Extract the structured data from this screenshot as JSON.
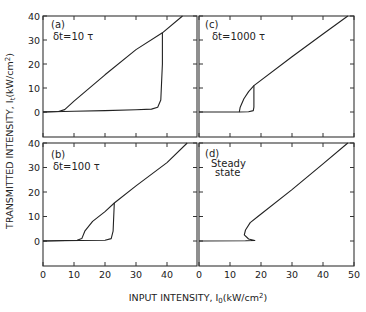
{
  "chart_data": {
    "type": "line",
    "title": "",
    "xlabel": "INPUT INTENSITY, I0(kW/cm2)",
    "ylabel": "TRANSMITTED INTENSITY, It(kW/cm2)",
    "layout": "2x2 grid of panels sharing axes",
    "grid": false,
    "xlim": [
      0,
      50
    ],
    "ylim": [
      -10,
      40
    ],
    "x_ticks_left": [
      0,
      10,
      20,
      30,
      40
    ],
    "x_ticks_right": [
      0,
      10,
      20,
      30,
      40,
      50
    ],
    "y_ticks": [
      0,
      10,
      20,
      30,
      40
    ],
    "panels": [
      {
        "id": "a",
        "label": "(a)",
        "annotation": "δt=10 τ",
        "position": "top-left",
        "series": [
          {
            "name": "upper branch",
            "points": [
              [
                0,
                0
              ],
              [
                5,
                0.2
              ],
              [
                7,
                1
              ],
              [
                10,
                4.5
              ],
              [
                20,
                15.5
              ],
              [
                30,
                26
              ],
              [
                38.5,
                33
              ],
              [
                45,
                40
              ]
            ]
          },
          {
            "name": "lower branch",
            "points": [
              [
                0,
                0
              ],
              [
                10,
                0.3
              ],
              [
                20,
                0.6
              ],
              [
                30,
                0.9
              ],
              [
                35,
                1.2
              ],
              [
                37,
                2
              ],
              [
                38,
                5
              ],
              [
                38.5,
                20
              ],
              [
                38.5,
                33
              ]
            ]
          }
        ]
      },
      {
        "id": "b",
        "label": "(b)",
        "annotation": "δt=100 τ",
        "position": "bottom-left",
        "series": [
          {
            "name": "upper branch",
            "points": [
              [
                0,
                0
              ],
              [
                11,
                0.3
              ],
              [
                12.5,
                1
              ],
              [
                13.5,
                4
              ],
              [
                16,
                8
              ],
              [
                20,
                12
              ],
              [
                23,
                15.5
              ],
              [
                30,
                22.5
              ],
              [
                40,
                32
              ],
              [
                46.5,
                40
              ]
            ]
          },
          {
            "name": "lower branch",
            "points": [
              [
                0,
                0
              ],
              [
                12,
                0.2
              ],
              [
                20,
                0.3
              ],
              [
                22,
                1
              ],
              [
                22.6,
                4
              ],
              [
                23,
                15.5
              ]
            ]
          }
        ]
      },
      {
        "id": "c",
        "label": "(c)",
        "annotation": "δt=1000 τ",
        "position": "top-right",
        "series": [
          {
            "name": "upper branch",
            "points": [
              [
                0,
                0
              ],
              [
                13,
                0
              ],
              [
                13.3,
                2
              ],
              [
                14.5,
                5.5
              ],
              [
                16,
                8.5
              ],
              [
                17.7,
                11
              ],
              [
                30,
                23
              ],
              [
                40,
                32.5
              ],
              [
                48,
                40
              ]
            ]
          },
          {
            "name": "lower branch",
            "points": [
              [
                13,
                0
              ],
              [
                16,
                0.1
              ],
              [
                17.5,
                0.6
              ],
              [
                17.7,
                2
              ],
              [
                17.7,
                11
              ]
            ]
          }
        ]
      },
      {
        "id": "d",
        "label": "(d)",
        "annotation": "Steady state",
        "position": "bottom-right",
        "series": [
          {
            "name": "steady-state S-curve",
            "points": [
              [
                0,
                0
              ],
              [
                15,
                0.1
              ],
              [
                18,
                0.2
              ],
              [
                16,
                0.8
              ],
              [
                14.6,
                2.5
              ],
              [
                15,
                4.5
              ],
              [
                16.5,
                7.5
              ],
              [
                19,
                10
              ],
              [
                30,
                21
              ],
              [
                40,
                31.5
              ],
              [
                48,
                40
              ]
            ]
          }
        ]
      }
    ]
  },
  "labels": {
    "ylabel_text": "TRANSMITTED INTENSITY, I",
    "ylabel_sub": "t",
    "ylabel_unit": "(kW/cm",
    "ylabel_sup": "2",
    "ylabel_close": ")",
    "xlabel_text": "INPUT INTENSITY, I",
    "xlabel_sub": "0",
    "xlabel_unit": "(kW/cm",
    "xlabel_sup": "2",
    "xlabel_close": ")",
    "panel_a": "(a)",
    "panel_a_note": "δt=10 τ",
    "panel_b": "(b)",
    "panel_b_note": "δt=100 τ",
    "panel_c": "(c)",
    "panel_c_note": "δt=1000 τ",
    "panel_d": "(d)",
    "panel_d_note_1": "Steady",
    "panel_d_note_2": "state"
  }
}
